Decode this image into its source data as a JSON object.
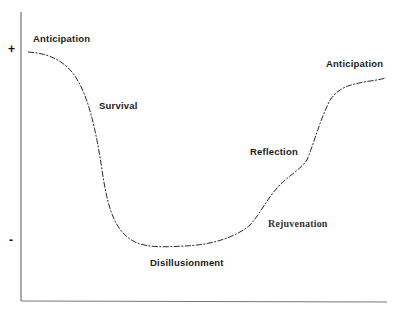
{
  "diagram": {
    "type": "emotional-cycle-of-change",
    "y_axis": {
      "top_mark": "+",
      "bottom_mark": "-"
    },
    "stages": [
      {
        "label": "Anticipation"
      },
      {
        "label": "Survival"
      },
      {
        "label": "Disillusionment"
      },
      {
        "label": "Rejuvenation"
      },
      {
        "label": "Reflection"
      },
      {
        "label": "Anticipation"
      }
    ],
    "colors": {
      "line": "#2a2a2a",
      "axis": "#444444",
      "text": "#1a1a1a"
    }
  }
}
